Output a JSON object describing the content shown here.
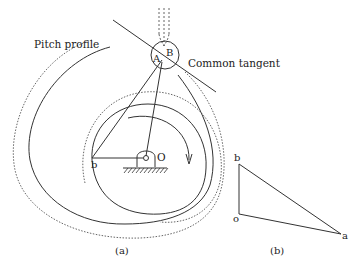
{
  "figure": {
    "panel_a": {
      "caption": "(a)",
      "labels": {
        "pitch_profile": "Pitch profile",
        "common_tangent": "Common tangent",
        "point_A": "A",
        "point_B": "B",
        "point_b": "b",
        "pivot_O": "O"
      }
    },
    "panel_b": {
      "caption": "(b)",
      "labels": {
        "vertex_b": "b",
        "vertex_o": "o",
        "vertex_a": "a"
      }
    }
  },
  "colors": {
    "line": "#333333",
    "dotted": "#555555",
    "background": "#ffffff"
  }
}
